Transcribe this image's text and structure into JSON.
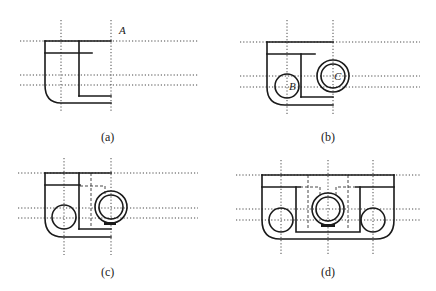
{
  "figure": {
    "panels": [
      {
        "id": "a",
        "caption": "(a)",
        "point_labels": [
          {
            "text": "A"
          }
        ]
      },
      {
        "id": "b",
        "caption": "(b)",
        "point_labels": [
          {
            "text": "B"
          },
          {
            "text": "C"
          }
        ]
      },
      {
        "id": "c",
        "caption": "(c)",
        "point_labels": []
      },
      {
        "id": "d",
        "caption": "(d)",
        "point_labels": []
      }
    ],
    "colors": {
      "line": "#1a1a1a",
      "background": "#ffffff"
    }
  }
}
